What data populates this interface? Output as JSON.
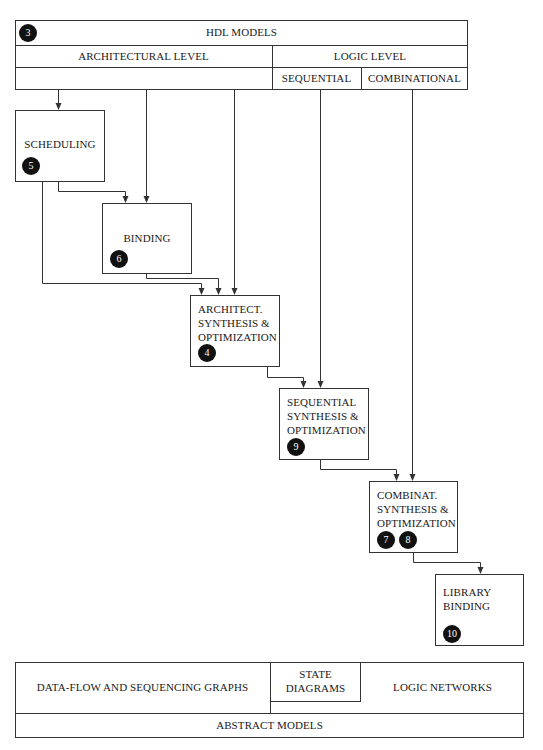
{
  "hdl_models": {
    "badge": "3",
    "title": "HDL MODELS",
    "architectural_level": "ARCHITECTURAL LEVEL",
    "logic_level": "LOGIC LEVEL",
    "sequential": "SEQUENTIAL",
    "combinational": "COMBINATIONAL"
  },
  "steps": [
    {
      "id": "scheduling",
      "label": "SCHEDULING",
      "badges": [
        "5"
      ]
    },
    {
      "id": "binding",
      "label": "BINDING",
      "badges": [
        "6"
      ]
    },
    {
      "id": "architect",
      "lines": [
        "ARCHITECT.",
        "SYNTHESIS &",
        "OPTIMIZATION"
      ],
      "badges": [
        "4"
      ]
    },
    {
      "id": "sequential",
      "lines": [
        "SEQUENTIAL",
        "SYNTHESIS &",
        "OPTIMIZATION"
      ],
      "badges": [
        "9"
      ]
    },
    {
      "id": "combinat",
      "lines": [
        "COMBINAT.",
        "SYNTHESIS &",
        "OPTIMIZATION"
      ],
      "badges": [
        "7",
        "8"
      ]
    },
    {
      "id": "library",
      "lines": [
        "LIBRARY",
        "BINDING"
      ],
      "badges": [
        "10"
      ]
    }
  ],
  "abstract_models": {
    "data_flow": "DATA-FLOW AND SEQUENCING GRAPHS",
    "state_diagrams_line1": "STATE",
    "state_diagrams_line2": "DIAGRAMS",
    "logic_networks": "LOGIC NETWORKS",
    "title": "ABSTRACT MODELS"
  }
}
